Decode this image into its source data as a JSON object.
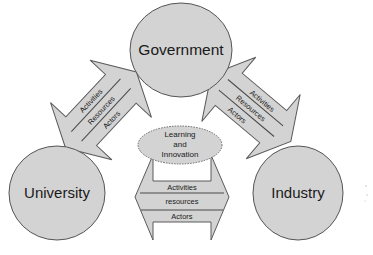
{
  "diagram": {
    "type": "triple-helix",
    "nodes": {
      "government": {
        "label": "Government"
      },
      "university": {
        "label": "University"
      },
      "industry": {
        "label": "Industry"
      },
      "center": {
        "line1": "Learning",
        "line2": "and",
        "line3": "Innovation"
      }
    },
    "arrows": {
      "university_government": {
        "bands": [
          "Activities",
          "Resources",
          "Actors"
        ]
      },
      "government_industry": {
        "bands": [
          "Activities",
          "Resources",
          "Actors"
        ]
      },
      "university_industry": {
        "bands": [
          "Activities",
          "resources",
          "Actors"
        ]
      }
    },
    "colors": {
      "fill": "#d3d3d3",
      "outline": "#555555",
      "text": "#1a1a1a",
      "background": "#ffffff"
    }
  }
}
